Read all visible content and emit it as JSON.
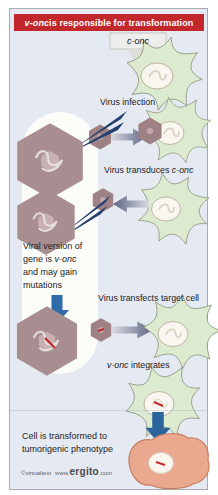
{
  "title": {
    "gene": "v-onc",
    "rest": " is responsible for transformation"
  },
  "diagram": {
    "c_onc_tag": "c-onc",
    "step1": "Virus infection",
    "step2_pre": "Virus transduces ",
    "step2_gene": "c-onc",
    "note_line1": "Viral version of",
    "note_line2_pre": "gene is ",
    "note_line2_gene": "v-onc",
    "note_line3": "and may gain",
    "note_line4": "mutations",
    "step3": "Virus transfects target cell",
    "step4_gene": "v-onc",
    "step4_rest": " integrates",
    "result_line1": "Cell is transformed to",
    "result_line2": "tumorigenic phenotype"
  },
  "footer": {
    "credit": "©virtualtext",
    "www": "www.",
    "brand": "ergito",
    "tld": ".com"
  },
  "colors": {
    "header_red": "#c2272c",
    "panel_bg": "#e4e9f2",
    "cell_green": "#dcead0",
    "cell_outline": "#8f977f",
    "virus_mauve": "#c7b1b3",
    "virus_outline": "#a98e91",
    "callout_navy": "#24406e",
    "block_arrow_blue": "#2f6ba8",
    "gradient_arrow_dark": "#5d6486",
    "tumor_pink": "#eaa98e",
    "tumor_outline": "#c97d5f",
    "mutation_red": "#c1272d",
    "capsule_white": "#fcfcf8"
  }
}
